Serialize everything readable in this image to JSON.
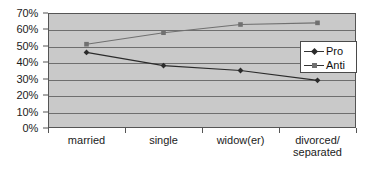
{
  "chart_data": {
    "type": "line",
    "title": "",
    "xlabel": "",
    "ylabel": "",
    "ylim": [
      0,
      70
    ],
    "ytick_values": [
      70,
      60,
      50,
      40,
      30,
      20,
      10,
      0
    ],
    "ytick_labels": [
      "70%",
      "60%",
      "50%",
      "40%",
      "30%",
      "20%",
      "10%",
      "0%"
    ],
    "grid": true,
    "legend_position": "right-inside",
    "categories": [
      "married",
      "single",
      "widow(er)",
      "divorced/\nseparated"
    ],
    "category_labels": [
      {
        "line1": "married",
        "line2": ""
      },
      {
        "line1": "single",
        "line2": ""
      },
      {
        "line1": "widow(er)",
        "line2": ""
      },
      {
        "line1": "divorced/",
        "line2": "separated"
      }
    ],
    "series": [
      {
        "name": "Pro",
        "marker": "diamond",
        "color": "#2b2b2b",
        "values": [
          46,
          38,
          35,
          29
        ]
      },
      {
        "name": "Anti",
        "marker": "square",
        "color": "#707070",
        "values": [
          51,
          58,
          63,
          64
        ]
      }
    ]
  },
  "legend": {
    "entries": [
      {
        "label": "Pro",
        "marker": "diamond-marker-icon"
      },
      {
        "label": "Anti",
        "marker": "square-marker-icon"
      }
    ]
  },
  "colors": {
    "plot_background": "#c9c9c9",
    "gridline": "#6e6e6e",
    "axis": "#555555",
    "series_pro": "#2b2b2b",
    "series_anti": "#707070",
    "text": "#1b1b1b"
  }
}
